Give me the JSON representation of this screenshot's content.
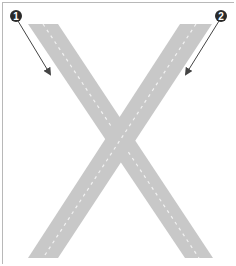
{
  "diagram": {
    "shape": "X-shaped road crossing",
    "band_color": "#c8c8c8",
    "dash_color": "#f2f2f2",
    "callout_color": "#2a2a2a",
    "arrow_color": "#444444",
    "callouts": [
      {
        "label": "1",
        "position": "top-left",
        "points_to": "left diagonal road"
      },
      {
        "label": "2",
        "position": "top-right",
        "points_to": "right diagonal road"
      }
    ]
  }
}
